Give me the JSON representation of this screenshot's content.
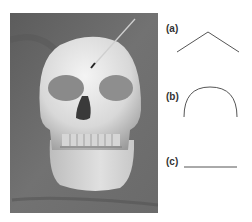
{
  "figure": {
    "photo": {
      "subject": "human skull (frontal view)",
      "annotation": "arrow pointing to brow ridge / forehead"
    },
    "panels": [
      {
        "label": "(a)",
        "shape": "angle / chevron"
      },
      {
        "label": "(b)",
        "shape": "semicircular arc"
      },
      {
        "label": "(c)",
        "shape": "straight horizontal line"
      }
    ]
  },
  "colors": {
    "background": "#ffffff",
    "photo_bg": "#6e6e6e",
    "bone": "#e6e6e6",
    "line": "#555555"
  }
}
